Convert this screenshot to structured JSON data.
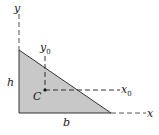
{
  "diagram": {
    "labels": {
      "y_axis": "y",
      "x_axis": "x",
      "y0_axis": "y",
      "y0_sub": "0",
      "x0_axis": "x",
      "x0_sub": "0",
      "height": "h",
      "base": "b",
      "centroid": "C"
    },
    "colors": {
      "fill": "#c8c8c8",
      "stroke": "#333333",
      "dash": "#444444"
    }
  }
}
